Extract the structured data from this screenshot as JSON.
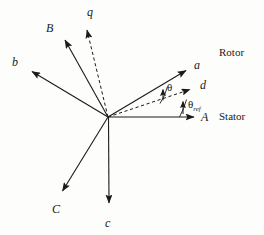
{
  "figure": {
    "background_color": "#fdfdfb",
    "stroke_color": "#1a1a1a",
    "origin": {
      "x": 108,
      "y": 117
    },
    "vectors": [
      {
        "name": "stator-axis-A",
        "label": "A",
        "style": "solid",
        "tip": {
          "x": 198,
          "y": 117
        },
        "label_pos": {
          "x": 201,
          "y": 111
        }
      },
      {
        "name": "rotor-axis-a",
        "label": "a",
        "style": "solid",
        "tip": {
          "x": 190,
          "y": 68
        },
        "label_pos": {
          "x": 194,
          "y": 59
        }
      },
      {
        "name": "stator-axis-B",
        "label": "B",
        "style": "solid",
        "tip": {
          "x": 62,
          "y": 36
        },
        "label_pos": {
          "x": 46,
          "y": 22
        }
      },
      {
        "name": "rotor-axis-b",
        "label": "b",
        "style": "solid",
        "tip": {
          "x": 27,
          "y": 69
        },
        "label_pos": {
          "x": 12,
          "y": 56
        }
      },
      {
        "name": "stator-axis-C",
        "label": "C",
        "style": "solid",
        "tip": {
          "x": 59,
          "y": 196
        },
        "label_pos": {
          "x": 52,
          "y": 203
        }
      },
      {
        "name": "rotor-axis-c",
        "label": "c",
        "style": "solid",
        "tip": {
          "x": 109,
          "y": 208
        },
        "label_pos": {
          "x": 105,
          "y": 217
        }
      },
      {
        "name": "q-axis",
        "label": "q",
        "style": "dashed",
        "tip": {
          "x": 88,
          "y": 22
        },
        "label_pos": {
          "x": 87,
          "y": 6
        }
      },
      {
        "name": "d-axis",
        "label": "d",
        "style": "dashed",
        "tip": {
          "x": 197,
          "y": 88
        },
        "label_pos": {
          "x": 200,
          "y": 79
        }
      }
    ],
    "angles": [
      {
        "name": "theta",
        "label": "θ",
        "sub": "",
        "label_pos": {
          "x": 167,
          "y": 82
        },
        "marker_x": 163
      },
      {
        "name": "theta-ref",
        "label": "θ",
        "sub": "ref",
        "label_pos": {
          "x": 188,
          "y": 99
        },
        "marker_x": 183
      }
    ],
    "frame_labels": [
      {
        "name": "rotor-frame-label",
        "text": "Rotor",
        "x": 219,
        "y": 47
      },
      {
        "name": "stator-frame-label",
        "text": "Stator",
        "x": 219,
        "y": 111
      }
    ]
  }
}
